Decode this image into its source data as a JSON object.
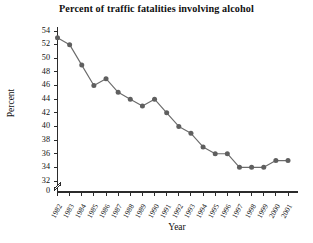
{
  "chart_data": {
    "type": "line",
    "title": "Percent of traffic fatalities involving alcohol",
    "xlabel": "Year",
    "ylabel": "Percent",
    "categories": [
      "1982",
      "1983",
      "1984",
      "1985",
      "1986",
      "1987",
      "1988",
      "1989",
      "1990",
      "1991",
      "1992",
      "1993",
      "1994",
      "1995",
      "1996",
      "1997",
      "1998",
      "1999",
      "2000",
      "2001"
    ],
    "x": [
      1982,
      1983,
      1984,
      1985,
      1986,
      1987,
      1988,
      1989,
      1990,
      1991,
      1992,
      1993,
      1994,
      1995,
      1996,
      1997,
      1998,
      1999,
      2000,
      2001
    ],
    "values": [
      53,
      52,
      49,
      46,
      47,
      45,
      44,
      43,
      44,
      42,
      40,
      39,
      37,
      36,
      36,
      34,
      34,
      34,
      35,
      35
    ],
    "series": [
      {
        "name": "Percent of traffic fatalities involving alcohol",
        "values": [
          53,
          52,
          49,
          46,
          47,
          45,
          44,
          43,
          44,
          42,
          40,
          39,
          37,
          36,
          36,
          34,
          34,
          34,
          35,
          35
        ]
      }
    ],
    "ylim": [
      32,
      54
    ],
    "yticks": [
      54,
      52,
      50,
      48,
      46,
      44,
      42,
      40,
      38,
      36,
      34,
      32
    ],
    "ytick_labels": [
      "54",
      "52",
      "50",
      "48",
      "46",
      "44",
      "42",
      "40",
      "38",
      "36",
      "34",
      "32"
    ],
    "axis_break": true,
    "axis_break_label": "0",
    "xtick_labels": [
      "1982",
      "1983",
      "1984",
      "1985",
      "1986",
      "1987",
      "1988",
      "1989",
      "1990",
      "1991",
      "1992",
      "1993",
      "1994",
      "1995",
      "1996",
      "1997",
      "1998",
      "1999",
      "2000",
      "2001"
    ],
    "grid": false,
    "legend": "none",
    "marker": "circle",
    "colors": {
      "line": "#6b6b6b",
      "marker": "#5f5f5f",
      "axis": "#2b2b2b",
      "text": "#111111",
      "background": "#ffffff"
    }
  }
}
